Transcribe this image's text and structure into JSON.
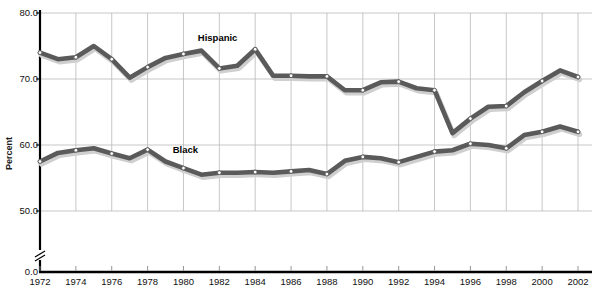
{
  "chart_data": {
    "type": "line",
    "title": "",
    "subtitle": "",
    "xlabel": "",
    "ylabel": "Percent",
    "xlim": [
      1972,
      2002
    ],
    "ylim": [
      45.0,
      80.0
    ],
    "y_axis_break": true,
    "y_axis_break_symbol": "axis-break",
    "grid": true,
    "legend_position": "inline-labels",
    "y_ticks": [
      "80.0",
      "70.0",
      "60.0",
      "50.0",
      "0.0"
    ],
    "y_tick_values": [
      80.0,
      70.0,
      60.0,
      50.0,
      0.0
    ],
    "x_ticks": [
      "1972",
      "1974",
      "1976",
      "1978",
      "1980",
      "1982",
      "1984",
      "1986",
      "1988",
      "1990",
      "1992",
      "1994",
      "1996",
      "1998",
      "2000",
      "2002"
    ],
    "x_tick_values": [
      1972,
      1974,
      1976,
      1978,
      1980,
      1982,
      1984,
      1986,
      1988,
      1990,
      1992,
      1994,
      1996,
      1998,
      2000,
      2002
    ],
    "x": [
      1972,
      1973,
      1974,
      1975,
      1976,
      1977,
      1978,
      1979,
      1980,
      1981,
      1982,
      1983,
      1984,
      1985,
      1986,
      1987,
      1988,
      1989,
      1990,
      1991,
      1992,
      1993,
      1994,
      1995,
      1996,
      1997,
      1998,
      1999,
      2000,
      2001,
      2002
    ],
    "series": [
      {
        "name": "Hispanic",
        "color": "#5a5a5a",
        "label_x": 1980.8,
        "label_y": 76.2,
        "values": [
          74.0,
          73.0,
          73.3,
          75.0,
          73.0,
          70.2,
          71.8,
          73.2,
          73.8,
          74.3,
          71.6,
          72.0,
          74.5,
          70.5,
          70.5,
          70.4,
          70.4,
          68.3,
          68.3,
          69.5,
          69.6,
          68.6,
          68.3,
          61.8,
          64.0,
          65.8,
          65.9,
          68.0,
          69.7,
          71.3,
          70.3
        ]
      },
      {
        "name": "Black",
        "color": "#5a5a5a",
        "label_x": 1979.4,
        "label_y": 59.2,
        "values": [
          57.5,
          58.8,
          59.2,
          59.5,
          58.7,
          58.0,
          59.3,
          57.5,
          56.5,
          55.5,
          55.8,
          55.8,
          55.9,
          55.8,
          56.0,
          56.2,
          55.6,
          57.6,
          58.2,
          58.0,
          57.4,
          58.2,
          59.0,
          59.2,
          60.2,
          60.0,
          59.5,
          61.5,
          62.0,
          62.8,
          62.0
        ]
      }
    ]
  },
  "axis": {
    "break_marker_name": "y-axis-break-marker"
  }
}
